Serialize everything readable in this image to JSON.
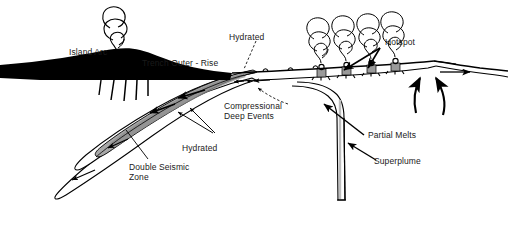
{
  "figure": {
    "type": "geological-cross-section",
    "background_color": "#ffffff",
    "ink_color": "#000000",
    "slab_fill_color": "#a8a8a8",
    "arc_fill_color": "#000000"
  },
  "labels": {
    "island_arc": "Island Arc",
    "trench_outer_rise": "Trench Outer - Rise",
    "hydrated_upper": "Hydrated",
    "hydrated_lower": "Hydrated",
    "compressional_deep_events": "Compressional\nDeep Events",
    "double_seismic_zone": "Double Seismic\nZone",
    "hotspot": "Hotspot",
    "partial_melts": "Partial Melts",
    "superplume": "Superplume"
  },
  "features": {
    "volcanic_plume_count": 1,
    "hotspot_plume_count": 4,
    "hotspot_vent_count": 4,
    "ridge_upwelling_arrow_count": 2,
    "seamount_bump_count": 3,
    "slab_motion_arrow_count": 4,
    "spreading_arrow_direction": "right",
    "subduction_direction": "left"
  }
}
